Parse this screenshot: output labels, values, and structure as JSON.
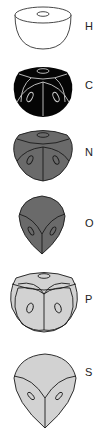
{
  "figure": {
    "items": [
      {
        "label": "H",
        "shape": "hemisphere",
        "fill": "#ffffff",
        "stroke": "#333333"
      },
      {
        "label": "C",
        "shape": "rounded-cube",
        "fill": "#050505",
        "stroke": "#cccccc"
      },
      {
        "label": "N",
        "shape": "rounded-cube",
        "fill": "#6a6a6a",
        "stroke": "#1a1a1a"
      },
      {
        "label": "O",
        "shape": "rounded-tetra",
        "fill": "#6a6a6a",
        "stroke": "#1a1a1a"
      },
      {
        "label": "P",
        "shape": "rounded-cube",
        "fill": "#d2d2d2",
        "stroke": "#1a1a1a"
      },
      {
        "label": "S",
        "shape": "rounded-tetra",
        "fill": "#d2d2d2",
        "stroke": "#1a1a1a"
      }
    ]
  }
}
